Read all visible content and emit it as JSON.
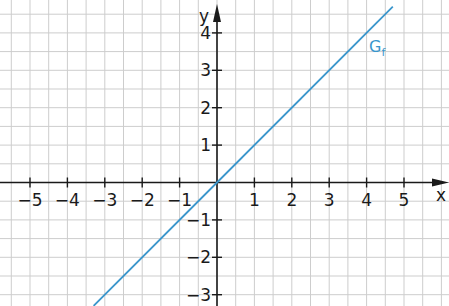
{
  "chart_data": {
    "type": "line",
    "title": "",
    "xlabel": "x",
    "ylabel": "y",
    "xlim": [
      -5.8,
      6.2
    ],
    "ylim": [
      -3.3,
      4.9
    ],
    "grid": true,
    "grid_step": 0.5,
    "x_ticks": [
      -5,
      -4,
      -3,
      -2,
      -1,
      1,
      2,
      3,
      4,
      5
    ],
    "x_tick_labels": [
      "−5",
      "−4",
      "−3",
      "−2",
      "−1",
      "1",
      "2",
      "3",
      "4",
      "5"
    ],
    "y_ticks": [
      -3,
      -2,
      -1,
      1,
      2,
      3,
      4
    ],
    "y_tick_labels": [
      "−3",
      "−2",
      "−1",
      "1",
      "2",
      "3",
      "4"
    ],
    "series": [
      {
        "name": "G_f",
        "label": "G",
        "label_subscript": "f",
        "function": "f(x) = x",
        "color": "#3a96cc",
        "x": [
          -3.3,
          0,
          4.7
        ],
        "y": [
          -3.3,
          0,
          4.7
        ]
      }
    ],
    "annotations": [
      {
        "text": "Gf",
        "x": 4.1,
        "y": 3.7,
        "color": "#3a96cc"
      }
    ]
  },
  "colors": {
    "grid": "#cdcdcd",
    "axis": "#1a1a1a",
    "line": "#3a96cc"
  },
  "labels": {
    "x_axis": "x",
    "y_axis": "y",
    "graph_name": "G",
    "graph_sub": "f"
  }
}
